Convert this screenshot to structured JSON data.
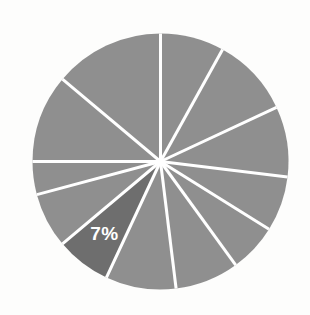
{
  "chart_data": {
    "type": "pie",
    "title": "",
    "subtitle": "",
    "xlabel": "",
    "ylabel": "",
    "grid": false,
    "legend": "none",
    "background_color": "#fdfdfc",
    "separator_color": "#ffffff",
    "separator_width": 3,
    "default_slice_color": "#8f8f8f",
    "highlight_slice_color": "#6e6e6e",
    "label_color": "#ffffff",
    "center_x": 160.5,
    "center_y": 161.5,
    "radius": 128,
    "start_angle_deg": 0,
    "direction": "clockwise",
    "categories": [
      "Slice 1",
      "Slice 2",
      "Slice 3",
      "Slice 4",
      "Slice 5",
      "Slice 6",
      "Slice 7",
      "Slice 8",
      "Slice 9",
      "Slice 10",
      "Slice 11",
      "Slice 12"
    ],
    "values": [
      8,
      10,
      9,
      7,
      6,
      8,
      9,
      7,
      7,
      10,
      11,
      8
    ],
    "slices": [
      {
        "index": 0,
        "value": 8,
        "start_deg": 0,
        "end_deg": 29,
        "color": "#8f8f8f",
        "highlighted": false,
        "label": ""
      },
      {
        "index": 1,
        "value": 10,
        "start_deg": 29,
        "end_deg": 65,
        "color": "#8f8f8f",
        "highlighted": false,
        "label": ""
      },
      {
        "index": 2,
        "value": 9,
        "start_deg": 65,
        "end_deg": 97,
        "color": "#8f8f8f",
        "highlighted": false,
        "label": ""
      },
      {
        "index": 3,
        "value": 7,
        "start_deg": 97,
        "end_deg": 122,
        "color": "#8f8f8f",
        "highlighted": false,
        "label": ""
      },
      {
        "index": 4,
        "value": 6,
        "start_deg": 122,
        "end_deg": 144,
        "color": "#8f8f8f",
        "highlighted": false,
        "label": ""
      },
      {
        "index": 5,
        "value": 8,
        "start_deg": 144,
        "end_deg": 173,
        "color": "#8f8f8f",
        "highlighted": false,
        "label": ""
      },
      {
        "index": 6,
        "value": 9,
        "start_deg": 173,
        "end_deg": 205,
        "color": "#8f8f8f",
        "highlighted": false,
        "label": ""
      },
      {
        "index": 7,
        "value": 7,
        "start_deg": 205,
        "end_deg": 230,
        "color": "#6e6e6e",
        "highlighted": true,
        "label": "7%"
      },
      {
        "index": 8,
        "value": 7,
        "start_deg": 230,
        "end_deg": 255,
        "color": "#8f8f8f",
        "highlighted": false,
        "label": ""
      },
      {
        "index": 9,
        "value": 10,
        "start_deg": 255,
        "end_deg": 270,
        "color": "#8f8f8f",
        "highlighted": false,
        "label": ""
      },
      {
        "index": 10,
        "value": 11,
        "start_deg": 270,
        "end_deg": 310,
        "color": "#8f8f8f",
        "highlighted": false,
        "label": ""
      },
      {
        "index": 11,
        "value": 8,
        "start_deg": 310,
        "end_deg": 360,
        "color": "#8f8f8f",
        "highlighted": false,
        "label": ""
      }
    ],
    "labels_shown": [
      "7%"
    ],
    "highlighted_slice_label": "7%",
    "highlighted_slice_percent": 7,
    "slice_count": 12
  }
}
